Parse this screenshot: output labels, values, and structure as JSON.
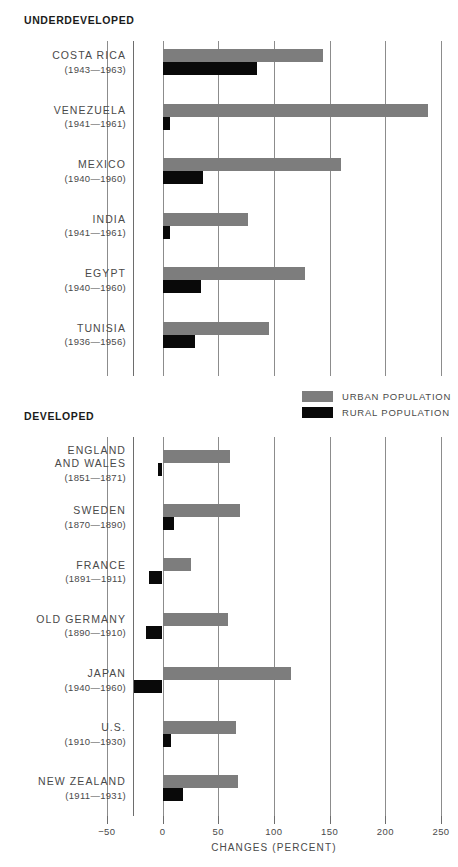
{
  "chart_data": {
    "type": "bar",
    "orientation": "horizontal",
    "title": "",
    "xlabel": "CHANGES (PERCENT)",
    "ylabel": "",
    "xlim": [
      -50,
      250
    ],
    "xticks": [
      -50,
      0,
      50,
      100,
      150,
      200,
      250
    ],
    "xtick_labels": [
      "−50",
      "0",
      "50",
      "100",
      "150",
      "200",
      "250"
    ],
    "grid": true,
    "legend_position": "center",
    "legend": [
      {
        "name": "URBAN POPULATION",
        "color": "#7d7d7d"
      },
      {
        "name": "RURAL POPULATION",
        "color": "#090909"
      }
    ],
    "series": [
      {
        "name": "URBAN POPULATION",
        "key": "urban",
        "color": "#7d7d7d"
      },
      {
        "name": "RURAL POPULATION",
        "key": "rural",
        "color": "#090909"
      }
    ],
    "groups": [
      {
        "heading": "UNDERDEVELOPED",
        "categories": [
          {
            "name": "COSTA RICA",
            "name_lines": [
              "COSTA RICA"
            ],
            "years": "(1943—1963)",
            "urban": 144,
            "rural": 85
          },
          {
            "name": "VENEZUELA",
            "name_lines": [
              "VENEZUELA"
            ],
            "years": "(1941—1961)",
            "urban": 238,
            "rural": 7
          },
          {
            "name": "MEXICO",
            "name_lines": [
              "MEXICO"
            ],
            "years": "(1940—1960)",
            "urban": 160,
            "rural": 36
          },
          {
            "name": "INDIA",
            "name_lines": [
              "INDIA"
            ],
            "years": "(1941—1961)",
            "urban": 77,
            "rural": 7
          },
          {
            "name": "EGYPT",
            "name_lines": [
              "EGYPT"
            ],
            "years": "(1940—1960)",
            "urban": 128,
            "rural": 35
          },
          {
            "name": "TUNISIA",
            "name_lines": [
              "TUNISIA"
            ],
            "years": "(1936—1956)",
            "urban": 96,
            "rural": 29
          }
        ]
      },
      {
        "heading": "DEVELOPED",
        "categories": [
          {
            "name": "ENGLAND AND WALES",
            "name_lines": [
              "ENGLAND",
              "AND WALES"
            ],
            "years": "(1851—1871)",
            "urban": 61,
            "rural": -4
          },
          {
            "name": "SWEDEN",
            "name_lines": [
              "SWEDEN"
            ],
            "years": "(1870—1890)",
            "urban": 70,
            "rural": 10
          },
          {
            "name": "FRANCE",
            "name_lines": [
              "FRANCE"
            ],
            "years": "(1891—1911)",
            "urban": 26,
            "rural": -12
          },
          {
            "name": "OLD GERMANY",
            "name_lines": [
              "OLD GERMANY"
            ],
            "years": "(1890—1910)",
            "urban": 59,
            "rural": -15
          },
          {
            "name": "JAPAN",
            "name_lines": [
              "JAPAN"
            ],
            "years": "(1940—1960)",
            "urban": 115,
            "rural": -26
          },
          {
            "name": "U.S.",
            "name_lines": [
              "U.S."
            ],
            "years": "(1910—1930)",
            "urban": 66,
            "rural": 8
          },
          {
            "name": "NEW ZEALAND",
            "name_lines": [
              "NEW ZEALAND"
            ],
            "years": "(1911—1931)",
            "urban": 68,
            "rural": 18
          }
        ]
      }
    ]
  }
}
